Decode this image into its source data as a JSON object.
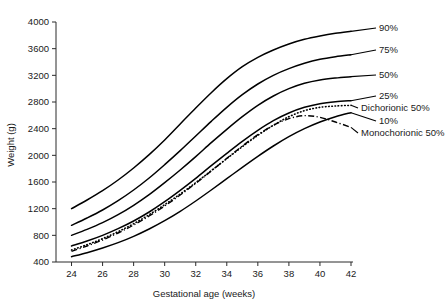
{
  "chart_data": {
    "type": "line",
    "title": "",
    "xlabel": "Gestational age (weeks)",
    "ylabel": "Weight (g)",
    "xlim": [
      23,
      42
    ],
    "ylim": [
      400,
      4000
    ],
    "xticks": [
      24,
      26,
      28,
      30,
      32,
      34,
      36,
      38,
      40,
      42
    ],
    "yticks": [
      400,
      800,
      1200,
      1600,
      2000,
      2400,
      2800,
      3200,
      3600,
      4000
    ],
    "grid": false,
    "legend_position": "right-inline-labels",
    "x": [
      24,
      25,
      26,
      27,
      28,
      29,
      30,
      31,
      32,
      33,
      34,
      35,
      36,
      37,
      38,
      39,
      40,
      41,
      42
    ],
    "series": [
      {
        "name": "90%",
        "label": "90%",
        "style": "solid",
        "values": [
          1200,
          1330,
          1470,
          1630,
          1810,
          2010,
          2230,
          2470,
          2710,
          2940,
          3150,
          3330,
          3470,
          3580,
          3670,
          3740,
          3790,
          3830,
          3860
        ]
      },
      {
        "name": "75%",
        "label": "75%",
        "style": "solid",
        "values": [
          950,
          1060,
          1180,
          1320,
          1480,
          1660,
          1860,
          2070,
          2290,
          2510,
          2720,
          2910,
          3070,
          3200,
          3300,
          3380,
          3440,
          3480,
          3510
        ]
      },
      {
        "name": "50%",
        "label": "50%",
        "style": "solid",
        "values": [
          800,
          890,
          990,
          1110,
          1250,
          1410,
          1590,
          1780,
          1980,
          2190,
          2390,
          2580,
          2750,
          2890,
          3000,
          3080,
          3130,
          3160,
          3180
        ]
      },
      {
        "name": "25%",
        "label": "25%",
        "style": "solid",
        "values": [
          640,
          715,
          800,
          900,
          1015,
          1150,
          1305,
          1475,
          1655,
          1845,
          2030,
          2210,
          2375,
          2520,
          2635,
          2720,
          2775,
          2805,
          2820
        ]
      },
      {
        "name": "Dichorionic 50%",
        "label": "Dichorionic 50%",
        "style": "dotted",
        "values": [
          580,
          660,
          750,
          855,
          975,
          1110,
          1260,
          1420,
          1590,
          1770,
          1950,
          2130,
          2300,
          2450,
          2580,
          2670,
          2720,
          2740,
          2750
        ]
      },
      {
        "name": "10%",
        "label": "10%",
        "style": "solid",
        "values": [
          480,
          540,
          610,
          690,
          785,
          895,
          1020,
          1160,
          1315,
          1480,
          1650,
          1820,
          1985,
          2140,
          2280,
          2400,
          2500,
          2580,
          2640
        ]
      },
      {
        "name": "Monochorionic 50%",
        "label": "Monochorionic 50%",
        "style": "dashdot",
        "values": [
          560,
          640,
          730,
          835,
          955,
          1090,
          1240,
          1405,
          1580,
          1765,
          1955,
          2140,
          2310,
          2450,
          2550,
          2595,
          2570,
          2500,
          2420
        ]
      }
    ],
    "annotations": [
      {
        "text": "90%",
        "attach_series": "90%"
      },
      {
        "text": "75%",
        "attach_series": "75%"
      },
      {
        "text": "50%",
        "attach_series": "50%"
      },
      {
        "text": "25%",
        "attach_series": "25%"
      },
      {
        "text": "Dichorionic 50%",
        "attach_series": "Dichorionic 50%"
      },
      {
        "text": "10%",
        "attach_series": "10%"
      },
      {
        "text": "Monochorionic 50%",
        "attach_series": "Monochorionic 50%"
      }
    ]
  },
  "colors": {
    "ink": "#000000",
    "axis": "#2b2b2b",
    "background": "#ffffff"
  }
}
